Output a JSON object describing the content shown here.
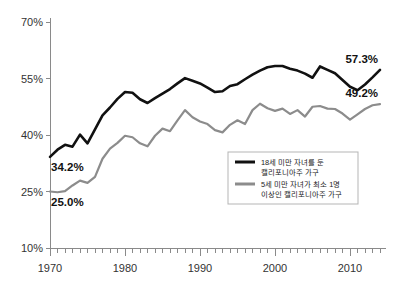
{
  "chart_data": {
    "type": "line",
    "title": "",
    "xlabel": "",
    "ylabel": "",
    "xlim": [
      1970,
      2014
    ],
    "ylim": [
      10,
      70
    ],
    "y_ticks": [
      10,
      25,
      40,
      55,
      70
    ],
    "y_tick_labels": [
      "10%",
      "25%",
      "40%",
      "55%",
      "70%"
    ],
    "x_ticks": [
      1970,
      1980,
      1990,
      2000,
      2010
    ],
    "x_tick_labels": [
      "1970",
      "1980",
      "1990",
      "2000",
      "2010"
    ],
    "x_minor_tick_step": 1,
    "grid": false,
    "legend_position": "center-right",
    "x": [
      1970,
      1971,
      1972,
      1973,
      1974,
      1975,
      1976,
      1977,
      1978,
      1979,
      1980,
      1981,
      1982,
      1983,
      1984,
      1985,
      1986,
      1987,
      1988,
      1989,
      1990,
      1991,
      1992,
      1993,
      1994,
      1995,
      1996,
      1997,
      1998,
      1999,
      2000,
      2001,
      2002,
      2003,
      2004,
      2005,
      2006,
      2007,
      2008,
      2009,
      2010,
      2011,
      2012,
      2013,
      2014
    ],
    "series": [
      {
        "name": "18세 미만 자녀를 둔 캘리포니아주 가구",
        "color": "#111111",
        "values": [
          34.2,
          36.1,
          37.4,
          36.9,
          40.1,
          37.8,
          41.5,
          45.2,
          47.3,
          49.6,
          51.4,
          51.2,
          49.5,
          48.5,
          49.8,
          51.0,
          52.2,
          53.7,
          55.1,
          54.4,
          53.7,
          52.6,
          51.4,
          51.6,
          53.0,
          53.5,
          54.8,
          56.0,
          57.1,
          58.0,
          58.3,
          58.3,
          57.6,
          57.1,
          56.3,
          55.2,
          58.2,
          57.3,
          56.4,
          54.6,
          52.8,
          51.9,
          53.4,
          55.3,
          57.3
        ]
      },
      {
        "name": "5세 미만 자녀가 최소 1명 이상인 캘리포니아주 가구",
        "color": "#8c8c8c",
        "values": [
          25.0,
          24.8,
          25.1,
          26.6,
          27.9,
          27.3,
          28.9,
          33.7,
          36.4,
          37.9,
          39.8,
          39.4,
          37.8,
          37.0,
          39.8,
          41.7,
          41.0,
          43.9,
          46.6,
          44.7,
          43.6,
          42.9,
          41.3,
          40.7,
          42.7,
          43.9,
          42.9,
          46.6,
          48.3,
          47.1,
          46.4,
          47.0,
          45.6,
          46.6,
          44.9,
          47.5,
          47.7,
          47.0,
          46.9,
          45.7,
          44.1,
          45.5,
          46.9,
          47.9,
          48.2
        ]
      }
    ],
    "annotations": [
      {
        "text": "34.2%",
        "x": 1970,
        "y": 34.2,
        "anchor": "below-right"
      },
      {
        "text": "25.0%",
        "x": 1970,
        "y": 25.0,
        "anchor": "below-right"
      },
      {
        "text": "57.3%",
        "x": 2014,
        "y": 57.3,
        "anchor": "above-left"
      },
      {
        "text": "49.2%",
        "x": 2014,
        "y": 48.2,
        "anchor": "above-left"
      }
    ],
    "legend_entries": [
      {
        "color": "#111111",
        "lines": [
          "18세 미만 자녀를 둔",
          "캘리포니아주 가구"
        ]
      },
      {
        "color": "#8c8c8c",
        "lines": [
          "5세 미만 자녀가 최소 1명",
          "이상인 캘리포니아주 가구"
        ]
      }
    ]
  }
}
